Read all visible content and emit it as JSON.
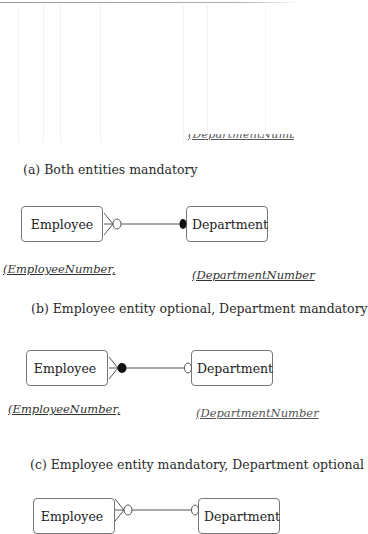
{
  "figure": {
    "clipped_top_key": "(DepartmentNumber)",
    "diagrams": [
      {
        "caption": "(a) Both entities mandatory",
        "left_entity": "Employee",
        "right_entity": "Department",
        "left_key": "(EmployeeNumber,",
        "right_key": "(DepartmentNumber",
        "left_end": {
          "cardinality": "many",
          "participation": "optional",
          "symbol": "open-circle"
        },
        "right_end": {
          "cardinality": "one",
          "participation": "mandatory",
          "symbol": "filled-circle"
        }
      },
      {
        "caption": "(b) Employee entity optional, Department  mandatory",
        "left_entity": "Employee",
        "right_entity": "Department",
        "left_key": "(EmployeeNumber,",
        "right_key": "(DepartmentNumber",
        "left_end": {
          "cardinality": "many",
          "participation": "mandatory",
          "symbol": "filled-circle"
        },
        "right_end": {
          "cardinality": "one",
          "participation": "optional",
          "symbol": "open-circle"
        }
      },
      {
        "caption": "(c) Employee entity mandatory, Department optional",
        "left_entity": "Employee",
        "right_entity": "Department",
        "left_end": {
          "cardinality": "many",
          "participation": "optional",
          "symbol": "open-circle"
        },
        "right_end": {
          "cardinality": "one",
          "participation": "optional",
          "symbol": "open-circle"
        }
      }
    ]
  }
}
